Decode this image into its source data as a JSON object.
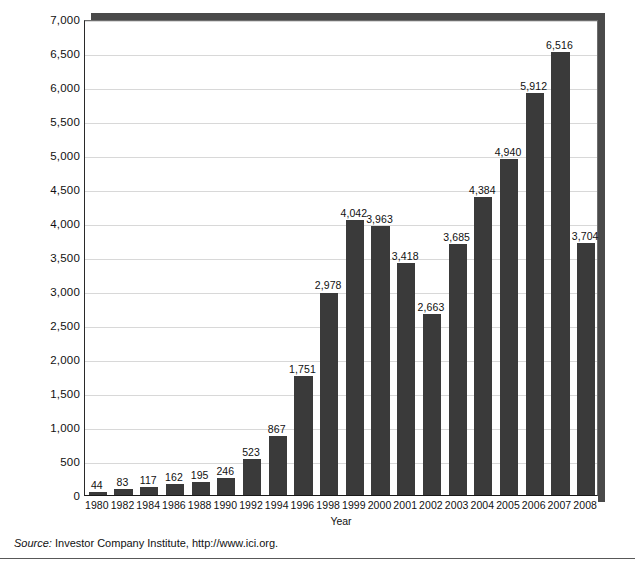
{
  "chart_data": {
    "type": "bar",
    "title": "",
    "subtitle": "",
    "xlabel": "Year",
    "ylabel": "Value of stocks owned through equity mutual funds\n(billions of dollars)",
    "ylim": [
      0,
      7000
    ],
    "ytick_step": 500,
    "ytick_labels": [
      "0",
      "500",
      "1,000",
      "1,500",
      "2,000",
      "2,500",
      "3,000",
      "3,500",
      "4,000",
      "4,500",
      "5,000",
      "5,500",
      "6,000",
      "6,500",
      "7,000"
    ],
    "ytick_values": [
      0,
      500,
      1000,
      1500,
      2000,
      2500,
      3000,
      3500,
      4000,
      4500,
      5000,
      5500,
      6000,
      6500,
      7000
    ],
    "grid": true,
    "grid_axis": "y",
    "legend": "none",
    "bar_color": "#3a3a3a",
    "categories": [
      "1980",
      "1982",
      "1984",
      "1986",
      "1988",
      "1990",
      "1992",
      "1994",
      "1996",
      "1998",
      "1999",
      "2000",
      "2001",
      "2002",
      "2003",
      "2004",
      "2005",
      "2006",
      "2007",
      "2008"
    ],
    "values": [
      44,
      83,
      117,
      162,
      195,
      246,
      523,
      867,
      1751,
      2978,
      4042,
      3963,
      3418,
      2663,
      3685,
      4384,
      4940,
      5912,
      6516,
      3704
    ],
    "value_labels": [
      "44",
      "83",
      "117",
      "162",
      "195",
      "246",
      "523",
      "867",
      "1,751",
      "2,978",
      "4,042",
      "3,963",
      "3,418",
      "2,663",
      "3,685",
      "4,384",
      "4,940",
      "5,912",
      "6,516",
      "3,704"
    ]
  },
  "source": {
    "label": "Source:",
    "text": " Investor Company Institute, http://www.ici.org."
  }
}
